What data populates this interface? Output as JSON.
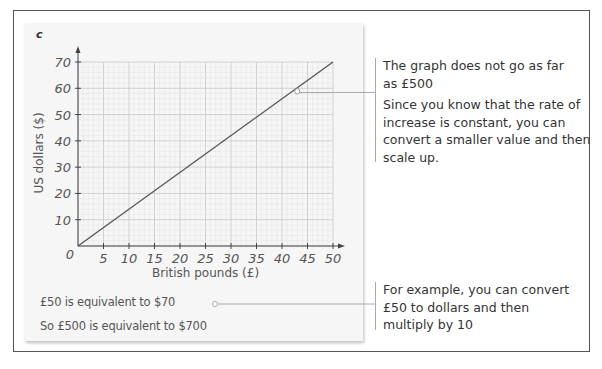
{
  "panel_label": "c",
  "chart_data": {
    "type": "line",
    "title": "",
    "xlabel": "British pounds (£)",
    "ylabel": "US dollars ($)",
    "x_ticks": [
      0,
      5,
      10,
      15,
      20,
      25,
      30,
      35,
      40,
      45,
      50
    ],
    "y_ticks": [
      0,
      10,
      20,
      30,
      40,
      50,
      60,
      70
    ],
    "xlim": [
      0,
      50
    ],
    "ylim": [
      0,
      70
    ],
    "grid": true,
    "series": [
      {
        "name": "conversion",
        "x": [
          0,
          50
        ],
        "y": [
          0,
          70
        ]
      }
    ],
    "annotations": [
      {
        "x": 43,
        "y": 60,
        "marker": "circle",
        "note": "The graph does not go as far as £500"
      }
    ]
  },
  "axis": {
    "origin_label": "0",
    "x_tick_labels": [
      "5",
      "10",
      "15",
      "20",
      "25",
      "30",
      "35",
      "40",
      "45",
      "50"
    ],
    "y_tick_labels": [
      "10",
      "20",
      "30",
      "40",
      "50",
      "60",
      "70"
    ],
    "xlabel": "British pounds (£)",
    "ylabel": "US dollars ($)"
  },
  "working": {
    "line1": "£50 is equivalent to $70",
    "line2": "So £500 is equivalent to $700"
  },
  "annotations": {
    "top": {
      "line1": "The graph does not go as far",
      "line2": "as £500",
      "para2_line1": "Since you know that the rate of",
      "para2_line2": "increase is constant, you can",
      "para2_line3": "convert a smaller value and then",
      "para2_line4": "scale up."
    },
    "bottom": {
      "line1": "For example, you can convert",
      "line2": "£50 to dollars and then",
      "line3": "multiply by 10"
    }
  },
  "colors": {
    "grid_minor": "#e2e2e2",
    "grid_major": "#c8c8c8",
    "axis": "#444444",
    "line": "#555555",
    "panel_bg": "#f6f6f6",
    "text": "#333333"
  }
}
